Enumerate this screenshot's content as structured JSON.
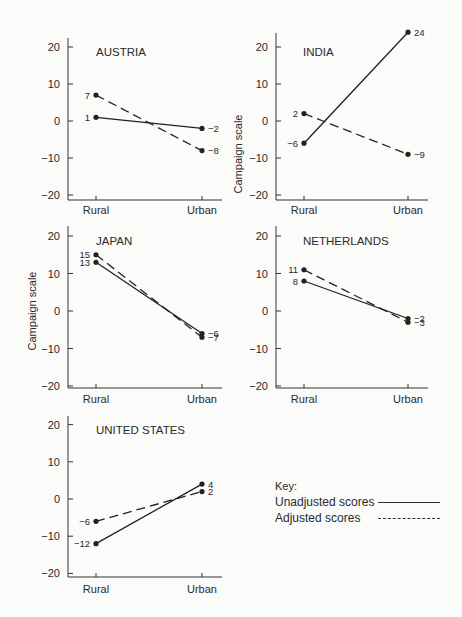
{
  "chart_data": [
    {
      "type": "line",
      "title": "AUSTRIA",
      "categories": [
        "Rural",
        "Urban"
      ],
      "series": [
        {
          "name": "Unadjusted scores",
          "values": [
            1,
            -2
          ]
        },
        {
          "name": "Adjusted scores",
          "values": [
            7,
            -8
          ]
        }
      ],
      "ylabel": "",
      "ylim": [
        -20,
        20
      ],
      "yticks": [
        20,
        10,
        0,
        -10,
        -20
      ]
    },
    {
      "type": "line",
      "title": "INDIA",
      "categories": [
        "Rural",
        "Urban"
      ],
      "series": [
        {
          "name": "Unadjusted scores",
          "values": [
            -6,
            24
          ]
        },
        {
          "name": "Adjusted scores",
          "values": [
            2,
            -9
          ]
        }
      ],
      "ylabel": "Campaign scale",
      "ylim": [
        -20,
        24
      ],
      "yticks": [
        20,
        10,
        0,
        -10,
        -20
      ]
    },
    {
      "type": "line",
      "title": "JAPAN",
      "categories": [
        "Rural",
        "Urban"
      ],
      "series": [
        {
          "name": "Unadjusted scores",
          "values": [
            13,
            -6
          ]
        },
        {
          "name": "Adjusted scores",
          "values": [
            15,
            -7
          ]
        }
      ],
      "ylabel": "Campaign scale",
      "ylim": [
        -20,
        20
      ],
      "yticks": [
        20,
        10,
        0,
        -10,
        -20
      ]
    },
    {
      "type": "line",
      "title": "NETHERLANDS",
      "categories": [
        "Rural",
        "Urban"
      ],
      "series": [
        {
          "name": "Unadjusted scores",
          "values": [
            8,
            -2
          ]
        },
        {
          "name": "Adjusted scores",
          "values": [
            11,
            -3
          ]
        }
      ],
      "ylabel": "",
      "ylim": [
        -20,
        20
      ],
      "yticks": [
        20,
        10,
        0,
        -10,
        -20
      ]
    },
    {
      "type": "line",
      "title": "UNITED STATES",
      "categories": [
        "Rural",
        "Urban"
      ],
      "series": [
        {
          "name": "Unadjusted scores",
          "values": [
            -12,
            4
          ]
        },
        {
          "name": "Adjusted scores",
          "values": [
            -6,
            2
          ]
        }
      ],
      "ylabel": "",
      "ylim": [
        -20,
        20
      ],
      "yticks": [
        20,
        10,
        0,
        -10,
        -20
      ]
    }
  ],
  "key": {
    "title": "Key:",
    "items": [
      {
        "label": "Unadjusted scores",
        "style": "solid"
      },
      {
        "label": "Adjusted scores",
        "style": "dashed"
      }
    ]
  },
  "ylabel": "Campaign scale"
}
